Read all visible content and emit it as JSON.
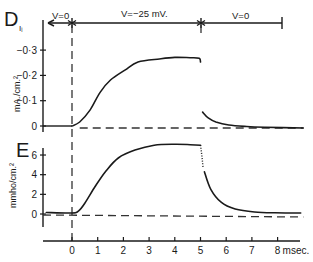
{
  "chart_data": [
    {
      "type": "line",
      "panel": "D",
      "panel_subscript": "Iᵢ",
      "ylabel": "mA./cm.²",
      "xlabel": "msec.",
      "xlim": [
        -1.3,
        9.0
      ],
      "ylim_display": [
        0.02,
        -0.36
      ],
      "yticks": [
        0,
        -0.1,
        -0.2,
        -0.3
      ],
      "ytick_labels": [
        "0",
        "−0·1",
        "−0·2",
        "−0·3"
      ],
      "voltage_steps": [
        {
          "label": "V=0",
          "from": -1.0,
          "to": 0
        },
        {
          "label": "V=−25 mV.",
          "from": 0,
          "to": 5
        },
        {
          "label": "V=0",
          "from": 5,
          "to": 8.8
        }
      ],
      "series": [
        {
          "name": "current during step",
          "style": "solid",
          "x": [
            -1.0,
            0,
            0.3,
            0.7,
            1.1,
            1.5,
            2.06,
            2.57,
            3.4,
            4.0,
            4.6,
            4.95,
            5.0
          ],
          "y": [
            0,
            0,
            -0.016,
            -0.063,
            -0.134,
            -0.182,
            -0.221,
            -0.253,
            -0.265,
            -0.271,
            -0.27,
            -0.268,
            -0.253
          ]
        },
        {
          "name": "tail current",
          "style": "solid",
          "x": [
            5.08,
            5.3,
            5.6,
            6.1,
            6.8,
            7.5,
            9.0
          ],
          "y": [
            -0.055,
            -0.032,
            -0.016,
            -0.004,
            0.002,
            0.005,
            0.008
          ]
        }
      ],
      "baseline": 0,
      "step_markers": [
        0,
        5
      ]
    },
    {
      "type": "line",
      "panel": "E",
      "ylabel": "mmho/cm.²",
      "xlabel": "msec.",
      "xlim": [
        -1.3,
        9.0
      ],
      "ylim": [
        -1.2,
        7.6
      ],
      "yticks": [
        0,
        2,
        4,
        6
      ],
      "ytick_labels": [
        "0",
        "2",
        "4",
        "6"
      ],
      "xticks": [
        0,
        1,
        2,
        3,
        4,
        5,
        6,
        7,
        8
      ],
      "xtick_labels": [
        "0",
        "1",
        "2",
        "3",
        "4",
        "5",
        "6",
        "7",
        "8"
      ],
      "xunit_label": "msec.",
      "series": [
        {
          "name": "conductance rise",
          "style": "solid",
          "x": [
            -1.0,
            0,
            0.25,
            0.5,
            0.9,
            1.3,
            1.8,
            2.45,
            3.2,
            4.0,
            4.6,
            5.0
          ],
          "y": [
            0.15,
            0.1,
            0.3,
            1.1,
            2.8,
            4.3,
            5.7,
            6.5,
            7.0,
            7.1,
            7.05,
            7.0
          ]
        },
        {
          "name": "extrapolated",
          "style": "dotted",
          "x": [
            5.0,
            5.05,
            5.1
          ],
          "y": [
            7.0,
            6.0,
            4.7
          ]
        },
        {
          "name": "conductance decay",
          "style": "solid",
          "x": [
            5.15,
            5.4,
            5.8,
            6.35,
            7.1,
            7.9,
            8.9
          ],
          "y": [
            4.3,
            2.5,
            1.2,
            0.5,
            0.2,
            0.12,
            0.1
          ]
        }
      ],
      "baseline": 0,
      "step_markers": [
        0,
        5
      ]
    }
  ],
  "labels": {
    "panel_d": "D",
    "panel_d_sub": "Iᵢ",
    "panel_e": "E",
    "d_ylabel": "mA./cm.²",
    "e_ylabel": "mmho/cm.²",
    "v_left": "V=0",
    "v_mid": "V=−25 mV.",
    "v_right": "V=0",
    "x_unit": "msec."
  }
}
